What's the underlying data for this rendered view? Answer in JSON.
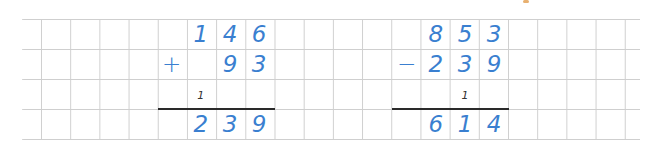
{
  "page": {
    "background": "#ffffff",
    "grid_color": "#cfcfcf",
    "digit_color": "#3a7fd0",
    "carry_color": "#333333",
    "rule_color": "#2a2a2a"
  },
  "addition": {
    "operator": "+",
    "top": [
      "1",
      "4",
      "6"
    ],
    "bottom": [
      "",
      "9",
      "3"
    ],
    "carry": [
      "1",
      "",
      ""
    ],
    "result": [
      "2",
      "3",
      "9"
    ]
  },
  "subtraction": {
    "operator": "−",
    "top": [
      "8",
      "5",
      "3"
    ],
    "bottom": [
      "2",
      "3",
      "9"
    ],
    "borrow": [
      "",
      "1",
      ""
    ],
    "result": [
      "6",
      "1",
      "4"
    ]
  }
}
